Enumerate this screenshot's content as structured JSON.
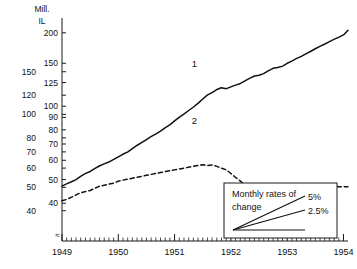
{
  "chart_data": {
    "type": "line",
    "title": "",
    "subtitle": "",
    "yscale": "log",
    "xlabel": "",
    "ylabel": "Mill. IL",
    "unit_line_1": "Mill.",
    "unit_line_2": "IL",
    "grid": false,
    "legend_position": "inline-labels",
    "xlim": [
      1949.0,
      1954.08
    ],
    "x_tick_labels": [
      "1949",
      "1950",
      "1951",
      "1952",
      "1953",
      "1954"
    ],
    "x_tick_values": [
      1949,
      1950,
      1951,
      1952,
      1953,
      1954
    ],
    "x_minor_ticks_per_year": 12,
    "axis_right_scale": {
      "for_series": "1",
      "ylim": [
        28,
        230
      ],
      "tick_labels": [
        "200",
        "150",
        "125",
        "100",
        "90",
        "80",
        "70",
        "60",
        "50",
        "40"
      ],
      "tick_values": [
        200,
        150,
        125,
        100,
        90,
        80,
        70,
        60,
        50,
        40
      ]
    },
    "axis_left_scale": {
      "for_series": "2",
      "ylim": [
        30,
        250
      ],
      "tick_labels": [
        "150",
        "120",
        "100",
        "80",
        "70",
        "60",
        "50",
        "40"
      ],
      "tick_values": [
        150,
        120,
        100,
        80,
        70,
        60,
        50,
        40
      ]
    },
    "series": [
      {
        "name": "1",
        "label": "1",
        "style": "solid",
        "scale": "right",
        "color": "#111111",
        "x": [
          1949.0,
          1949.08,
          1949.17,
          1949.25,
          1949.33,
          1949.42,
          1949.5,
          1949.58,
          1949.67,
          1949.75,
          1949.83,
          1949.92,
          1950.0,
          1950.08,
          1950.17,
          1950.25,
          1950.33,
          1950.42,
          1950.5,
          1950.58,
          1950.67,
          1950.75,
          1950.83,
          1950.92,
          1951.0,
          1951.08,
          1951.17,
          1951.25,
          1951.33,
          1951.42,
          1951.5,
          1951.58,
          1951.67,
          1951.75,
          1951.83,
          1951.92,
          1952.0,
          1952.08,
          1952.17,
          1952.25,
          1952.33,
          1952.42,
          1952.5,
          1952.58,
          1952.67,
          1952.75,
          1952.83,
          1952.92,
          1953.0,
          1953.08,
          1953.17,
          1953.25,
          1953.33,
          1953.42,
          1953.5,
          1953.58,
          1953.67,
          1953.75,
          1953.83,
          1953.92,
          1954.0,
          1954.08
        ],
        "values": [
          47,
          48,
          49,
          50,
          51.5,
          53,
          54,
          55.5,
          57,
          58,
          59,
          60.5,
          62,
          63.5,
          65,
          67,
          69,
          71,
          73,
          75,
          77,
          79,
          81.5,
          84,
          87,
          90,
          93,
          96,
          99,
          103,
          107,
          111,
          114,
          117,
          119,
          118,
          120,
          122,
          124,
          127,
          130,
          133,
          134,
          136,
          140,
          143,
          144,
          146,
          150,
          153,
          157,
          160,
          164,
          168,
          172,
          176,
          180,
          184,
          188,
          192,
          196,
          205
        ]
      },
      {
        "name": "2",
        "label": "2",
        "style": "dashed",
        "scale": "left",
        "color": "#111111",
        "x": [
          1949.0,
          1949.08,
          1949.17,
          1949.25,
          1949.33,
          1949.42,
          1949.5,
          1949.58,
          1949.67,
          1949.75,
          1949.83,
          1949.92,
          1950.0,
          1950.08,
          1950.17,
          1950.25,
          1950.33,
          1950.42,
          1950.5,
          1950.58,
          1950.67,
          1950.75,
          1950.83,
          1950.92,
          1951.0,
          1951.08,
          1951.17,
          1951.25,
          1951.33,
          1951.42,
          1951.5,
          1951.58,
          1951.67,
          1951.75,
          1951.83,
          1951.92,
          1952.0,
          1952.08,
          1952.17,
          1952.25,
          1952.33,
          1952.42,
          1952.5,
          1952.58,
          1952.67,
          1952.75,
          1952.83,
          1952.92,
          1953.0,
          1953.08,
          1953.17,
          1953.25,
          1953.33,
          1953.42,
          1953.5,
          1953.58,
          1953.67,
          1953.75,
          1953.83,
          1953.92,
          1954.0,
          1954.08
        ],
        "values": [
          44,
          44.5,
          45.5,
          46.5,
          47.5,
          48,
          48.5,
          49.5,
          50.5,
          51,
          51.5,
          52,
          53,
          53.5,
          54,
          54.5,
          55,
          55.5,
          56,
          56.5,
          57,
          57.5,
          58,
          58.5,
          59,
          59.5,
          60,
          60.5,
          61,
          61.5,
          62,
          61.5,
          61.8,
          61,
          60,
          59,
          57,
          55,
          53,
          51,
          50,
          49.5,
          49,
          48.8,
          48.6,
          48.5,
          48.6,
          48.7,
          48.8,
          49.5,
          49.2,
          48.9,
          49,
          49.2,
          49.5,
          49.8,
          50,
          50.2,
          50.4,
          50.3,
          50.2,
          50.3
        ]
      }
    ],
    "annotations": [
      {
        "name": "series-1-label",
        "text": "1",
        "x": 1951.35,
        "y_px": 67
      },
      {
        "name": "series-2-label",
        "text": "2",
        "x": 1951.35,
        "y_px": 124
      }
    ],
    "legend_inset": {
      "title_line_1": "Monthly rates of",
      "title_line_2": "change",
      "entries": [
        {
          "label": "5%",
          "rate_percent": 5
        },
        {
          "label": "2.5%",
          "rate_percent": 2.5
        },
        {
          "label": "",
          "rate_percent": 0
        }
      ]
    }
  }
}
